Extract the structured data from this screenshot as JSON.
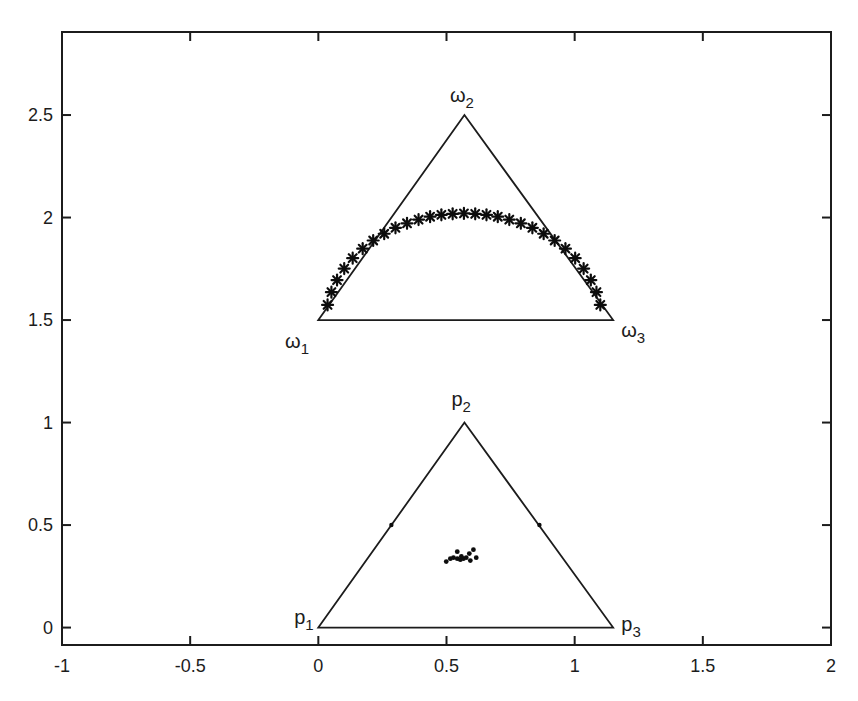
{
  "window": {
    "width": 858,
    "height": 701,
    "background": "#ffffff"
  },
  "figure": {
    "axis_color": "#1c1c1c",
    "marker_color": "#0d0d0d",
    "tick_len": 9,
    "box_stroke": 2,
    "tick_label_size": 18,
    "vertex_label_size": 20,
    "vertex_sub_size": 15
  },
  "chart_data": {
    "type": "scatter",
    "title": "",
    "xlabel": "",
    "ylabel": "",
    "grid": false,
    "legend": null,
    "xlim": [
      -1,
      2
    ],
    "ylim": [
      -0.085,
      2.905
    ],
    "x_ticks": [
      -1,
      -0.5,
      0,
      0.5,
      1,
      1.5,
      2
    ],
    "x_tick_labels": [
      "-1",
      "-0.5",
      "0",
      "0.5",
      "1",
      "1.5",
      "2"
    ],
    "y_ticks": [
      0,
      0.5,
      1,
      1.5,
      2,
      2.5
    ],
    "y_tick_labels": [
      "0",
      "0.5",
      "1",
      "1.5",
      "2",
      "2.5"
    ],
    "simplexes": [
      {
        "name": "omega-simplex",
        "vertices": [
          [
            0,
            1.5
          ],
          [
            0.57,
            2.5
          ],
          [
            1.15,
            1.5
          ]
        ],
        "vertex_labels": [
          {
            "base": "ω",
            "sub": "1",
            "x": -0.083,
            "y": 1.398
          },
          {
            "base": "ω",
            "sub": "2",
            "x": 0.56,
            "y": 2.598
          },
          {
            "base": "ω",
            "sub": "3",
            "x": 1.228,
            "y": 1.451
          }
        ]
      },
      {
        "name": "p-simplex",
        "vertices": [
          [
            0,
            0
          ],
          [
            0.57,
            1.0
          ],
          [
            1.15,
            0
          ]
        ],
        "vertex_labels": [
          {
            "base": "p",
            "sub": "1",
            "x": -0.056,
            "y": 0.052
          },
          {
            "base": "p",
            "sub": "2",
            "x": 0.557,
            "y": 1.115
          },
          {
            "base": "p",
            "sub": "3",
            "x": 1.22,
            "y": 0.018
          }
        ]
      }
    ],
    "series": [
      {
        "name": "omega-arc",
        "marker": "asterisk",
        "marker_radius": 5.5,
        "points": [
          [
            0.036,
            1.574
          ],
          [
            0.051,
            1.636
          ],
          [
            0.073,
            1.695
          ],
          [
            0.101,
            1.751
          ],
          [
            0.134,
            1.802
          ],
          [
            0.173,
            1.848
          ],
          [
            0.214,
            1.888
          ],
          [
            0.257,
            1.921
          ],
          [
            0.301,
            1.95
          ],
          [
            0.346,
            1.972
          ],
          [
            0.391,
            1.99
          ],
          [
            0.436,
            2.004
          ],
          [
            0.48,
            2.013
          ],
          [
            0.524,
            2.018
          ],
          [
            0.568,
            2.02
          ],
          [
            0.612,
            2.018
          ],
          [
            0.656,
            2.013
          ],
          [
            0.7,
            2.004
          ],
          [
            0.745,
            1.99
          ],
          [
            0.79,
            1.972
          ],
          [
            0.835,
            1.95
          ],
          [
            0.879,
            1.921
          ],
          [
            0.922,
            1.888
          ],
          [
            0.964,
            1.848
          ],
          [
            1.002,
            1.802
          ],
          [
            1.035,
            1.751
          ],
          [
            1.063,
            1.695
          ],
          [
            1.085,
            1.636
          ],
          [
            1.1,
            1.574
          ]
        ]
      },
      {
        "name": "p-cluster",
        "marker": "dot",
        "marker_radius": 2.4,
        "points": [
          [
            0.605,
            0.38
          ],
          [
            0.589,
            0.361
          ],
          [
            0.542,
            0.37
          ],
          [
            0.515,
            0.336
          ],
          [
            0.527,
            0.341
          ],
          [
            0.542,
            0.336
          ],
          [
            0.554,
            0.331
          ],
          [
            0.566,
            0.336
          ],
          [
            0.577,
            0.341
          ],
          [
            0.499,
            0.322
          ],
          [
            0.616,
            0.341
          ],
          [
            0.593,
            0.327
          ],
          [
            0.558,
            0.347
          ]
        ]
      },
      {
        "name": "p-edge-points",
        "marker": "dot",
        "marker_radius": 2.2,
        "points": [
          [
            0.285,
            0.5
          ],
          [
            0.8625,
            0.5
          ]
        ]
      }
    ]
  }
}
